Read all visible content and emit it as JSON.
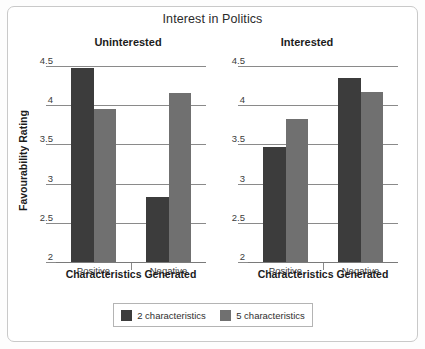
{
  "chart_data": {
    "type": "bar",
    "title": "Interest in Politics",
    "xlabel": "Characteristics Generated",
    "ylabel": "Favourability Rating",
    "ylim": [
      2,
      4.5
    ],
    "yticks": [
      "2",
      "2.5",
      "3",
      "3.5",
      "4",
      "4.5"
    ],
    "ytick_values": [
      2,
      2.5,
      3,
      3.5,
      4,
      4.5
    ],
    "grid": true,
    "legend_position": "bottom",
    "categories": [
      "Positive",
      "Negative"
    ],
    "panels": [
      {
        "title": "Uninterested",
        "categories": [
          "Positive",
          "Negative"
        ],
        "series": [
          {
            "name": "2 characteristics",
            "color": "#3c3c3c",
            "values": [
              4.47,
              2.83
            ]
          },
          {
            "name": "5 characteristics",
            "color": "#707070",
            "values": [
              3.95,
              4.15
            ]
          }
        ]
      },
      {
        "title": "Interested",
        "categories": [
          "Positive",
          "Negative"
        ],
        "series": [
          {
            "name": "2 characteristics",
            "color": "#3c3c3c",
            "values": [
              3.47,
              4.35
            ]
          },
          {
            "name": "5 characteristics",
            "color": "#707070",
            "values": [
              3.82,
              4.17
            ]
          }
        ]
      }
    ],
    "legend": [
      {
        "label": "2 characteristics",
        "color": "#3c3c3c"
      },
      {
        "label": "5 characteristics",
        "color": "#707070"
      }
    ]
  }
}
